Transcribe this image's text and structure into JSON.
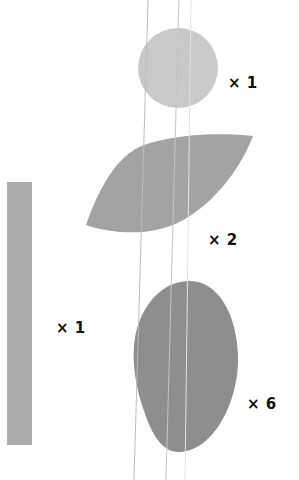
{
  "colors": {
    "background": "#ffffff",
    "circle": "#c9c9c9",
    "leaf": "#a3a3a3",
    "bar": "#ababab",
    "oval": "#8e8e8e",
    "line": "#bdbdbd",
    "label": "#111111"
  },
  "shapes": {
    "circle": {
      "name": "circle",
      "count_label": "× 1"
    },
    "leaf": {
      "name": "leaf",
      "count_label": "× 2"
    },
    "bar": {
      "name": "bar",
      "count_label": "× 1"
    },
    "oval": {
      "name": "oval",
      "count_label": "× 6"
    }
  }
}
